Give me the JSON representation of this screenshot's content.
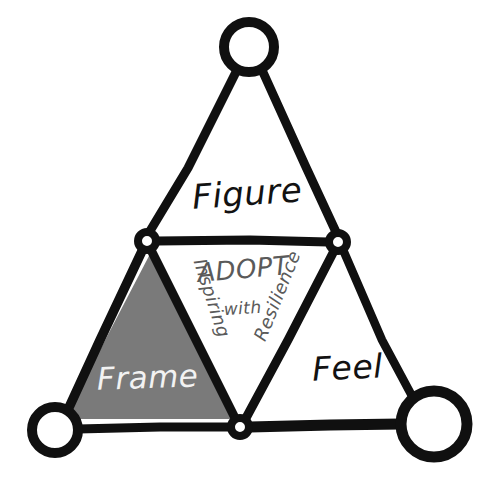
{
  "diagram": {
    "background_color": "#ffffff",
    "ink_color": "#101010",
    "fill_gray": "#7a7a7a",
    "label_light_color": "#f2f2f2",
    "label_gray_color": "#5a5a5a",
    "outer_labels": [
      {
        "id": "figure",
        "text": "Figure",
        "x": 248,
        "y": 205,
        "rotate": -4,
        "size": 34
      },
      {
        "id": "frame",
        "text": "Frame",
        "x": 148,
        "y": 388,
        "rotate": -2,
        "size": 31
      },
      {
        "id": "feel",
        "text": "Feel",
        "x": 348,
        "y": 379,
        "rotate": -3,
        "size": 33
      }
    ],
    "center_labels": [
      {
        "id": "adopt",
        "text": "ADOPT",
        "x": 244,
        "y": 278,
        "rotate": -5,
        "size": 26
      },
      {
        "id": "with",
        "text": "with",
        "x": 243,
        "y": 314,
        "rotate": -4,
        "size": 17
      },
      {
        "id": "inspiring",
        "text": "Inspiring",
        "x": 206,
        "y": 300,
        "rotate": 72,
        "size": 18
      },
      {
        "id": "resilience",
        "text": "Resilience",
        "x": 283,
        "y": 298,
        "rotate": -68,
        "size": 18
      }
    ],
    "vertex_nodes": [
      {
        "id": "top-outer",
        "cx": 249,
        "cy": 47,
        "r": 25,
        "stroke": 10
      },
      {
        "id": "bottom-left-outer",
        "cx": 55,
        "cy": 430,
        "r": 23,
        "stroke": 10
      },
      {
        "id": "bottom-right-outer",
        "cx": 434,
        "cy": 424,
        "r": 33,
        "stroke": 11
      },
      {
        "id": "inner-left",
        "cx": 147,
        "cy": 241,
        "r": 9,
        "stroke": 8
      },
      {
        "id": "inner-right",
        "cx": 338,
        "cy": 242,
        "r": 9,
        "stroke": 8
      },
      {
        "id": "inner-bottom",
        "cx": 240,
        "cy": 427,
        "r": 9,
        "stroke": 8
      }
    ],
    "edges": [
      {
        "id": "outer-left-up",
        "from": "top-outer",
        "to": "inner-left",
        "width": 9
      },
      {
        "id": "outer-right-up",
        "from": "top-outer",
        "to": "inner-right",
        "width": 9
      },
      {
        "id": "outer-left-down",
        "from": "inner-left",
        "to": "bottom-left-outer",
        "width": 9
      },
      {
        "id": "outer-bottom",
        "from": "bottom-left-outer",
        "to": "inner-bottom",
        "width": 9
      },
      {
        "id": "outer-bottom-right",
        "from": "inner-bottom",
        "to": "bottom-right-outer",
        "width": 10
      },
      {
        "id": "outer-right-down",
        "from": "inner-right",
        "to": "bottom-right-outer",
        "width": 9
      },
      {
        "id": "inner-top",
        "from": "inner-left",
        "to": "inner-right",
        "width": 9
      },
      {
        "id": "inner-left-diag",
        "from": "inner-left",
        "to": "inner-bottom",
        "width": 9
      },
      {
        "id": "inner-right-diag",
        "from": "inner-right",
        "to": "inner-bottom",
        "width": 9
      }
    ],
    "shaded_region": {
      "id": "frame-triangle",
      "label": "Frame",
      "fill": "#7a7a7a",
      "points": "150,254 232,419 64,419"
    }
  }
}
